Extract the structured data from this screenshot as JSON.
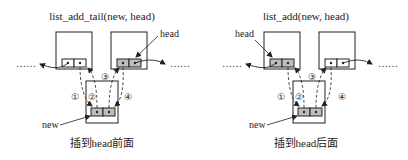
{
  "left": {
    "title": "list_add_tail(new, head)",
    "head_label": "head",
    "new_label": "new",
    "caption": "插到head前面",
    "dots_left": "……",
    "dots_right": "……",
    "steps": [
      "①",
      "②",
      "③",
      "④"
    ]
  },
  "right": {
    "title": "list_add(new, head)",
    "head_label": "head",
    "new_label": "new",
    "caption": "插到head后面",
    "dots_left": "……",
    "dots_right": "……",
    "steps": [
      "①",
      "②",
      "③",
      "④"
    ]
  },
  "colors": {
    "stroke": "#222222",
    "cell_fill_gray": "#bdbdbd",
    "cell_fill_white": "#ffffff",
    "background": "#ffffff"
  }
}
